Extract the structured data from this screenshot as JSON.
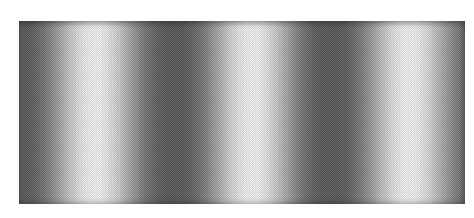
{
  "figure": {
    "type": "sine-grating",
    "bar_orientation": "vertical",
    "cycles_visible": 3,
    "background_hex": "#ffffff",
    "light_hex": "#f3f3f1",
    "dark_hex": "#565656",
    "halftone_gamma": 1.3,
    "geometry": {
      "left_px": 19,
      "top_px": 21,
      "width_px": 446,
      "height_px": 183,
      "period_px": 157,
      "bright_center_px": 95
    }
  }
}
